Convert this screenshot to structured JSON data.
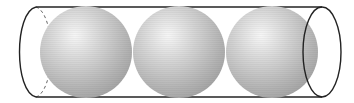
{
  "figure": {
    "title": "",
    "sphere_count": 3,
    "colors": {
      "background": "#ffffff",
      "outline": "#222222",
      "sphere_light": "#f4f4f4",
      "sphere_mid": "#c8c8c8",
      "sphere_dark": "#9a9a9a"
    }
  }
}
